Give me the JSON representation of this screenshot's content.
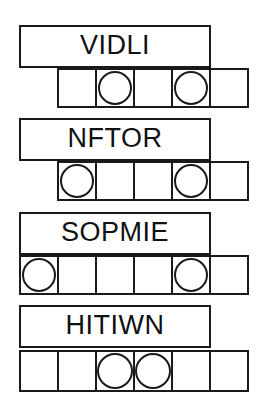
{
  "sheet": {
    "title": "word puzzle worksheet",
    "background_color": "#ffffff",
    "ink_color": "#1a1a1a"
  },
  "groups": [
    {
      "id": "group-1",
      "word": "VIDLI",
      "word_box": {
        "x": 19,
        "y": 25,
        "width": 192,
        "height": 43
      },
      "cell_row": {
        "x": 57,
        "y": 68,
        "width": 192,
        "height": 40,
        "cell_count": 5,
        "cell_width": 40
      },
      "circled_cells": [
        2,
        4
      ],
      "cells": [
        {
          "index": 1,
          "circled": false,
          "letter": ""
        },
        {
          "index": 2,
          "circled": true,
          "letter": ""
        },
        {
          "index": 3,
          "circled": false,
          "letter": ""
        },
        {
          "index": 4,
          "circled": true,
          "letter": ""
        },
        {
          "index": 5,
          "circled": false,
          "letter": ""
        }
      ]
    },
    {
      "id": "group-2",
      "word": "NFTOR",
      "word_box": {
        "x": 19,
        "y": 118,
        "width": 192,
        "height": 43
      },
      "cell_row": {
        "x": 57,
        "y": 161,
        "width": 192,
        "height": 40,
        "cell_count": 5,
        "cell_width": 40
      },
      "circled_cells": [
        1,
        4
      ],
      "cells": [
        {
          "index": 1,
          "circled": true,
          "letter": ""
        },
        {
          "index": 2,
          "circled": false,
          "letter": ""
        },
        {
          "index": 3,
          "circled": false,
          "letter": ""
        },
        {
          "index": 4,
          "circled": true,
          "letter": ""
        },
        {
          "index": 5,
          "circled": false,
          "letter": ""
        }
      ]
    },
    {
      "id": "group-3",
      "word": "SOPMIE",
      "word_box": {
        "x": 19,
        "y": 212,
        "width": 192,
        "height": 43
      },
      "cell_row": {
        "x": 19,
        "y": 255,
        "width": 230,
        "height": 40,
        "cell_count": 6,
        "cell_width": 40
      },
      "circled_cells": [
        1,
        5
      ],
      "cells": [
        {
          "index": 1,
          "circled": true,
          "letter": ""
        },
        {
          "index": 2,
          "circled": false,
          "letter": ""
        },
        {
          "index": 3,
          "circled": false,
          "letter": ""
        },
        {
          "index": 4,
          "circled": false,
          "letter": ""
        },
        {
          "index": 5,
          "circled": true,
          "letter": ""
        },
        {
          "index": 6,
          "circled": false,
          "letter": ""
        }
      ]
    },
    {
      "id": "group-4",
      "word": "HITIWN",
      "word_box": {
        "x": 19,
        "y": 305,
        "width": 192,
        "height": 43
      },
      "cell_row": {
        "x": 19,
        "y": 350,
        "width": 230,
        "height": 42,
        "cell_count": 6,
        "cell_width": 40
      },
      "circled_cells": [
        3,
        4
      ],
      "cells": [
        {
          "index": 1,
          "circled": false,
          "letter": ""
        },
        {
          "index": 2,
          "circled": false,
          "letter": ""
        },
        {
          "index": 3,
          "circled": true,
          "letter": ""
        },
        {
          "index": 4,
          "circled": true,
          "letter": ""
        },
        {
          "index": 5,
          "circled": false,
          "letter": ""
        },
        {
          "index": 6,
          "circled": false,
          "letter": ""
        }
      ]
    }
  ]
}
